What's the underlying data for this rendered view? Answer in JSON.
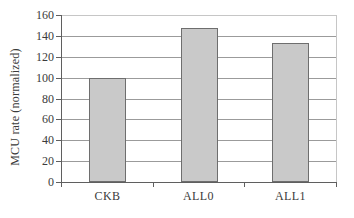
{
  "chart_data": {
    "type": "bar",
    "categories": [
      "CKB",
      "ALL0",
      "ALL1"
    ],
    "values": [
      100,
      148,
      133
    ],
    "ylabel": "MCU rate (normalized)",
    "ylim": [
      0,
      160
    ],
    "ytick_step": 20,
    "ytick_labels": [
      "0",
      "20",
      "40",
      "60",
      "80",
      "100",
      "120",
      "140",
      "160"
    ],
    "grid": true,
    "legend": "none"
  },
  "colors": {
    "background": "#ffffff",
    "bar_fill": "#c9c9c9",
    "bar_border": "#6e6e6e",
    "gridline": "#9b9b9b",
    "axis": "#5f5f5f",
    "plot_border": "#c6c6c6",
    "text": "#3b3b3b"
  }
}
